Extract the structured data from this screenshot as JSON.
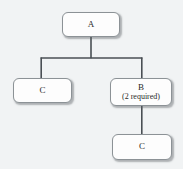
{
  "diagram": {
    "type": "fault-tree-block-diagram",
    "background_color": "#f1f3f4",
    "node_fill_color": "#fdfdfd",
    "node_border_color": "#8c9296",
    "connector_color": "#4a4f54",
    "nodes": [
      {
        "id": "a",
        "name": "node-a",
        "label": "A",
        "sublabel": "",
        "x": 62,
        "y": 12,
        "width": 58,
        "height": 25
      },
      {
        "id": "c-left",
        "name": "node-c-left",
        "label": "C",
        "sublabel": "",
        "x": 13,
        "y": 78,
        "width": 59,
        "height": 25
      },
      {
        "id": "b",
        "name": "node-b",
        "label": "B",
        "sublabel": "(2 required)",
        "x": 110,
        "y": 78,
        "width": 62,
        "height": 28
      },
      {
        "id": "c-bottom",
        "name": "node-c-bottom",
        "label": "C",
        "sublabel": "",
        "x": 112,
        "y": 134,
        "width": 60,
        "height": 26
      }
    ],
    "connectors": [
      {
        "name": "connector-a-to-bus",
        "from": "a",
        "to": "bus",
        "path": "M 91 37 L 91 58"
      },
      {
        "name": "connector-bus",
        "from": "bus-left",
        "to": "bus-right",
        "path": "M 41 58 L 142 58"
      },
      {
        "name": "connector-bus-to-c-left",
        "from": "bus",
        "to": "c-left",
        "path": "M 41 58 L 41 78"
      },
      {
        "name": "connector-bus-to-b",
        "from": "bus",
        "to": "b",
        "path": "M 142 58 L 142 78"
      },
      {
        "name": "connector-b-to-c-bottom",
        "from": "b",
        "to": "c-bottom",
        "path": "M 142 106 L 142 134"
      }
    ]
  }
}
